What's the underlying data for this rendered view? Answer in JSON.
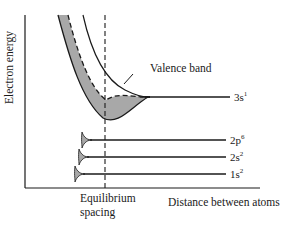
{
  "diagram": {
    "title": "",
    "axes": {
      "y_label": "Electron energy",
      "x_label": "Distance between atoms"
    },
    "annotations": {
      "valence_band": "Valence band",
      "equilibrium_line1": "Equilibrium",
      "equilibrium_line2": "spacing"
    },
    "levels": [
      {
        "id": "3s",
        "base": "3s",
        "sup": "1"
      },
      {
        "id": "2p",
        "base": "2p",
        "sup": "6"
      },
      {
        "id": "2s",
        "base": "2s",
        "sup": "2"
      },
      {
        "id": "1s",
        "base": "1s",
        "sup": "2"
      }
    ],
    "colors": {
      "line": "#1a1a1a",
      "band_fill": "#a8a8a8",
      "background": "#ffffff"
    }
  }
}
